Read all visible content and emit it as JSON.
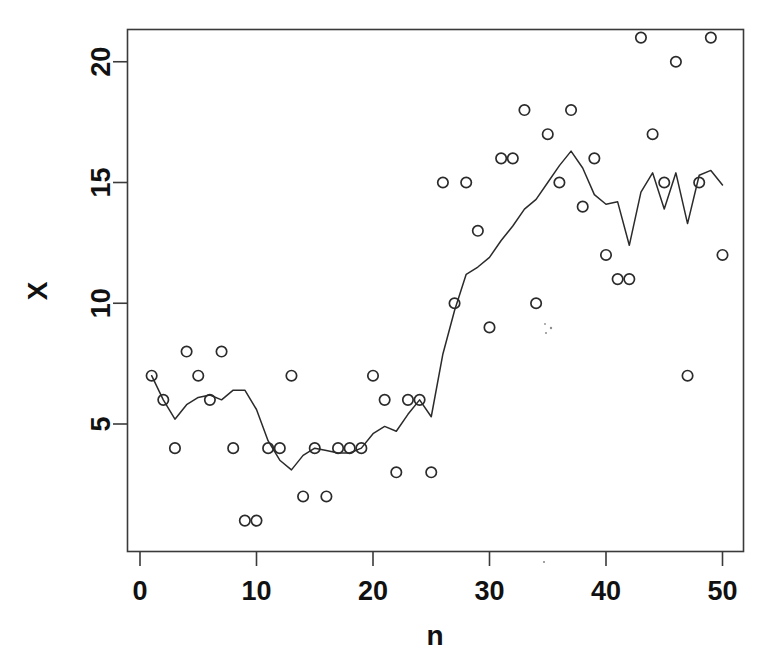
{
  "chart_data": {
    "type": "scatter",
    "title": "",
    "subtitle": "",
    "xlabel": "n",
    "ylabel": "X",
    "xlim": [
      0,
      51
    ],
    "ylim": [
      0.2,
      21.8
    ],
    "xticks": [
      0,
      10,
      20,
      30,
      40,
      50
    ],
    "yticks": [
      5,
      10,
      15,
      20
    ],
    "xticklabels": [
      "0",
      "10",
      "20",
      "30",
      "40",
      "50"
    ],
    "yticklabels": [
      "5",
      "10",
      "15",
      "20"
    ],
    "grid": false,
    "legend": null,
    "legend_position": "none",
    "frame": "box",
    "series": [
      {
        "name": "observations",
        "type": "scatter",
        "marker": "open-circle",
        "color": "#2b2b2b",
        "x": [
          1,
          2,
          3,
          4,
          5,
          6,
          7,
          8,
          9,
          10,
          11,
          12,
          13,
          14,
          15,
          16,
          17,
          18,
          19,
          20,
          21,
          22,
          23,
          24,
          25,
          26,
          27,
          28,
          29,
          30,
          31,
          32,
          33,
          34,
          35,
          36,
          37,
          38,
          39,
          40,
          41,
          42,
          43,
          44,
          45,
          46,
          47,
          48,
          49,
          50
        ],
        "y": [
          7,
          6,
          4,
          8,
          7,
          6,
          8,
          4,
          1,
          1,
          4,
          4,
          7,
          2,
          4,
          2,
          4,
          4,
          4,
          7,
          6,
          3,
          6,
          6,
          3,
          15,
          10,
          15,
          13,
          9,
          16,
          16,
          18,
          10,
          17,
          15,
          18,
          14,
          16,
          12,
          11,
          11,
          21,
          17,
          15,
          20,
          7,
          15,
          21,
          12
        ]
      },
      {
        "name": "smoothed-trend",
        "type": "line",
        "color": "#2b2b2b",
        "x": [
          1,
          2,
          3,
          4,
          5,
          6,
          7,
          8,
          9,
          10,
          11,
          12,
          13,
          14,
          15,
          16,
          17,
          18,
          19,
          20,
          21,
          22,
          23,
          24,
          25,
          26,
          27,
          28,
          29,
          30,
          31,
          32,
          33,
          34,
          35,
          36,
          37,
          38,
          39,
          40,
          41,
          42,
          43,
          44,
          45,
          46,
          47,
          48,
          49,
          50
        ],
        "y": [
          7.0,
          6.0,
          5.2,
          5.8,
          6.1,
          6.2,
          6.0,
          6.4,
          6.4,
          5.6,
          4.3,
          3.5,
          3.1,
          3.7,
          4.0,
          3.9,
          3.8,
          3.8,
          4.0,
          4.6,
          4.9,
          4.7,
          5.4,
          6.0,
          5.3,
          7.9,
          9.7,
          11.2,
          11.5,
          11.9,
          12.6,
          13.2,
          13.9,
          14.3,
          15.0,
          15.7,
          16.3,
          15.6,
          14.5,
          14.1,
          14.2,
          12.4,
          14.6,
          15.4,
          13.9,
          15.4,
          13.3,
          15.3,
          15.5,
          14.9
        ]
      }
    ]
  },
  "axes": {
    "xlabel": "n",
    "ylabel": "X"
  }
}
